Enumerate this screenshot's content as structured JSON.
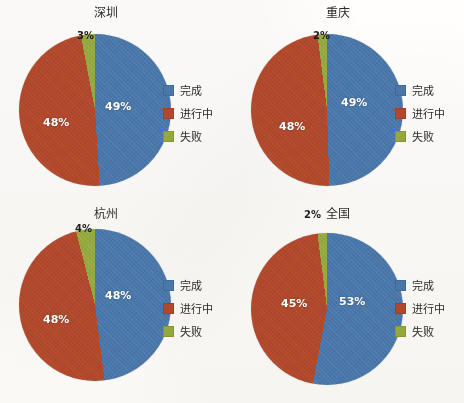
{
  "figure": {
    "background_color": "#fdfcfa",
    "panel_count": 4
  },
  "palette": {
    "completed": "#4A76A8",
    "in_progress": "#B0492C",
    "failed": "#94A83E",
    "label_light": "#FFFFFF",
    "label_dark": "#1D1D1D",
    "title_color": "#2B2B2B"
  },
  "legend": {
    "items": [
      {
        "label": "完成",
        "color_key": "completed",
        "swatch": "square-swatch"
      },
      {
        "label": "进行中",
        "color_key": "in_progress",
        "swatch": "square-swatch"
      },
      {
        "label": "失败",
        "color_key": "failed",
        "swatch": "square-swatch"
      }
    ]
  },
  "chart_data": [
    {
      "type": "pie",
      "title": "深圳",
      "labels": [
        "完成",
        "进行中",
        "失败"
      ],
      "values": [
        49,
        48,
        3
      ],
      "value_labels": [
        "49%",
        "48%",
        "3%"
      ],
      "colors": [
        "#4A76A8",
        "#B0492C",
        "#94A83E"
      ],
      "units": "percent",
      "legend_position": "right",
      "start_angle_deg": 0,
      "direction": "clockwise"
    },
    {
      "type": "pie",
      "title": "重庆",
      "labels": [
        "完成",
        "进行中",
        "失败"
      ],
      "values": [
        49,
        48,
        2
      ],
      "value_labels": [
        "49%",
        "48%",
        "2%"
      ],
      "colors": [
        "#4A76A8",
        "#B0492C",
        "#94A83E"
      ],
      "units": "percent",
      "legend_position": "right",
      "start_angle_deg": 0,
      "direction": "clockwise"
    },
    {
      "type": "pie",
      "title": "杭州",
      "labels": [
        "完成",
        "进行中",
        "失败"
      ],
      "values": [
        48,
        48,
        4
      ],
      "value_labels": [
        "48%",
        "48%",
        "4%"
      ],
      "colors": [
        "#4A76A8",
        "#B0492C",
        "#94A83E"
      ],
      "units": "percent",
      "legend_position": "right",
      "start_angle_deg": 0,
      "direction": "clockwise"
    },
    {
      "type": "pie",
      "title": "全国",
      "labels": [
        "完成",
        "进行中",
        "失败"
      ],
      "values": [
        53,
        45,
        2
      ],
      "value_labels": [
        "53%",
        "45%",
        "2%"
      ],
      "colors": [
        "#4A76A8",
        "#B0492C",
        "#94A83E"
      ],
      "units": "percent",
      "legend_position": "right",
      "start_angle_deg": 0,
      "direction": "clockwise",
      "outside_labels": [
        "失败"
      ]
    }
  ],
  "panels": [
    {
      "title": "深圳",
      "pie_left": 19,
      "pie_top": 34,
      "legend_left": 163,
      "legend_top": 82,
      "labels": [
        {
          "text": "49%",
          "left": 86,
          "top": 66,
          "tone": "light"
        },
        {
          "text": "48%",
          "left": 24,
          "top": 82,
          "tone": "light"
        },
        {
          "text": "3%",
          "left": 58,
          "top": -4,
          "tone": "dark"
        }
      ]
    },
    {
      "title": "重庆",
      "pie_left": 19,
      "pie_top": 34,
      "legend_left": 163,
      "legend_top": 82,
      "labels": [
        {
          "text": "49%",
          "left": 90,
          "top": 62,
          "tone": "light"
        },
        {
          "text": "48%",
          "left": 28,
          "top": 86,
          "tone": "light"
        },
        {
          "text": "2%",
          "left": 62,
          "top": -4,
          "tone": "dark"
        }
      ]
    },
    {
      "title": "杭州",
      "pie_left": 19,
      "pie_top": 28,
      "legend_left": 163,
      "legend_top": 76,
      "labels": [
        {
          "text": "48%",
          "left": 86,
          "top": 60,
          "tone": "light"
        },
        {
          "text": "48%",
          "left": 24,
          "top": 84,
          "tone": "light"
        },
        {
          "text": "4%",
          "left": 56,
          "top": -6,
          "tone": "dark"
        }
      ]
    },
    {
      "title": "全国",
      "pie_left": 19,
      "pie_top": 32,
      "legend_left": 163,
      "legend_top": 76,
      "labels": [
        {
          "text": "53%",
          "left": 88,
          "top": 62,
          "tone": "light"
        },
        {
          "text": "45%",
          "left": 30,
          "top": 64,
          "tone": "light"
        },
        {
          "text": "2%",
          "left": 53,
          "top": -24,
          "tone": "dark"
        }
      ]
    }
  ]
}
